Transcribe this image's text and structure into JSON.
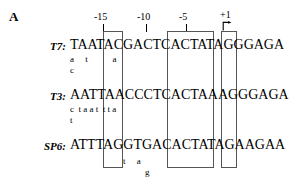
{
  "figure": {
    "panel_letter": "A",
    "ruler": {
      "ticks": [
        {
          "label": "-15",
          "x": 103
        },
        {
          "label": "-10",
          "x": 146
        },
        {
          "label": "-5",
          "x": 185
        },
        {
          "label": "+1",
          "x": 226
        }
      ],
      "start_arrow_name": "transcription-start-arrow"
    },
    "boxes": [
      {
        "name": "conserved-box-1",
        "left": 103,
        "top": 31,
        "width": 20,
        "height": 137
      },
      {
        "name": "conserved-box-2",
        "left": 167,
        "top": 31,
        "width": 47,
        "height": 137
      },
      {
        "name": "conserved-box-3",
        "left": 221,
        "top": 31,
        "width": 16,
        "height": 137
      }
    ],
    "rows": [
      {
        "name": "t7",
        "label": "T7:",
        "sequence": "TAATACGACTCACTATAGGGAGA",
        "alt_lines": [
          {
            "text": "a     t           a",
            "offset_x": 70
          },
          {
            "text": "c",
            "offset_x": 70
          }
        ]
      },
      {
        "name": "t3",
        "label": "T3:",
        "sequence": "AATTAACCCTCACTAAAGGGAGA",
        "alt_lines": [
          {
            "text": "c  t a a t  t t a",
            "offset_x": 70
          },
          {
            "text": "t",
            "offset_x": 70
          }
        ]
      },
      {
        "name": "sp6",
        "label": "SP6:",
        "sequence": "ATTTAGGTGACACTATAGAAGAA",
        "alt_lines": [
          {
            "text": "t     a",
            "offset_x": 123
          },
          {
            "text": "g",
            "offset_x": 145
          }
        ]
      }
    ]
  }
}
